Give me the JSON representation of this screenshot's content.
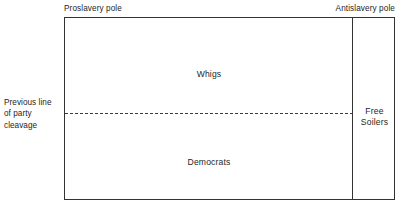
{
  "figure": {
    "type": "political-spectrum-diagram",
    "background_color": "#ffffff",
    "line_color": "#333333",
    "text_color": "#262626"
  },
  "axis_labels": {
    "left_pole": "Proslavery pole",
    "right_pole": "Antislavery pole"
  },
  "side_annotation": {
    "line1": "Previous line",
    "line2": "of party",
    "line3": "cleavage"
  },
  "regions": [
    {
      "id": "whigs",
      "label": "Whigs",
      "position": "upper-main"
    },
    {
      "id": "democrats",
      "label": "Democrats",
      "position": "lower-main"
    },
    {
      "id": "free-soilers",
      "label_line1": "Free",
      "label_line2": "Soilers",
      "position": "right-column"
    }
  ]
}
